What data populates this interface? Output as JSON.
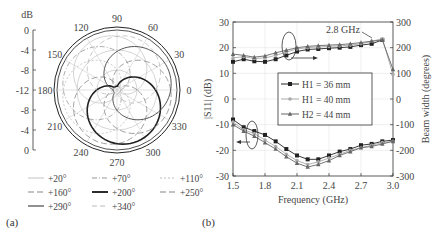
{
  "panel_labels": {
    "a": "(a)",
    "b": "(b)"
  },
  "polar": {
    "radial_unit": "dB",
    "radial_ticks": [
      "0",
      "-4",
      "-8",
      "-12",
      "-8",
      "-4",
      "0"
    ],
    "angle_ticks": [
      "0",
      "30",
      "60",
      "90",
      "120",
      "150",
      "180",
      "210",
      "240",
      "270",
      "300",
      "330"
    ],
    "legend": [
      "+20°",
      "+70°",
      "+110°",
      "+160°",
      "+200°",
      "+250°",
      "+290°",
      "+340°"
    ]
  },
  "right": {
    "legend": [
      "H1 = 36 mm",
      "H1 = 40 mm",
      "H2 = 44 mm"
    ],
    "annotation": "2.8 GHz",
    "xlabel": "Frequency (GHz)",
    "ylabel_left": "|S11| (dB)",
    "ylabel_right": "Beam width (degrees)",
    "x_ticks": [
      "1.5",
      "1.8",
      "2.1",
      "2.4",
      "2.7",
      "3.0"
    ],
    "y_left_ticks": [
      "30",
      "20",
      "10",
      "0",
      "-10",
      "-20",
      "-30"
    ],
    "y_right_ticks": [
      "300",
      "200",
      "100",
      "0",
      "-100",
      "-200",
      "-300"
    ]
  },
  "chart_data": [
    {
      "type": "line",
      "title": "(a) Radiation patterns (polar)",
      "radial_range_db": [
        -12,
        0
      ],
      "angle_ticks_deg": [
        0,
        30,
        60,
        90,
        120,
        150,
        180,
        210,
        240,
        270,
        300,
        330
      ],
      "series_names": [
        "+20°",
        "+70°",
        "+110°",
        "+160°",
        "+200°",
        "+250°",
        "+290°",
        "+340°"
      ],
      "highlight_series": "+200°",
      "polar": true
    },
    {
      "type": "line",
      "title": "(b) |S11| and beam width vs frequency",
      "xlabel": "Frequency (GHz)",
      "ylabel": "|S11| (dB)",
      "ylabel_right": "Beam width (degrees)",
      "xlim": [
        1.5,
        3.0
      ],
      "ylim": [
        -30,
        30
      ],
      "ylim_right": [
        -300,
        300
      ],
      "x": [
        1.5,
        1.6,
        1.7,
        1.8,
        1.9,
        2.0,
        2.1,
        2.2,
        2.3,
        2.4,
        2.5,
        2.6,
        2.7,
        2.8,
        2.9,
        3.0
      ],
      "series": [
        {
          "name": "H1 = 36 mm |S11|",
          "axis": "left",
          "values": [
            -8,
            -11,
            -12.5,
            -14,
            -16.5,
            -19.5,
            -22,
            -23.5,
            -23.5,
            -22,
            -20.5,
            -19.5,
            -18,
            -17.5,
            -16.5,
            -16
          ]
        },
        {
          "name": "H1 = 40 mm |S11|",
          "axis": "left",
          "values": [
            -9,
            -12,
            -13.5,
            -16,
            -18.5,
            -21.5,
            -24,
            -25.5,
            -24.5,
            -23,
            -21.5,
            -20,
            -19,
            -18,
            -17,
            -16.5
          ]
        },
        {
          "name": "H2 = 44 mm |S11|",
          "axis": "left",
          "values": [
            -10,
            -12.5,
            -14.5,
            -17,
            -19.5,
            -22.5,
            -25,
            -26.5,
            -25.5,
            -24,
            -22,
            -20.5,
            -19,
            -18.5,
            -17.5,
            -16.5
          ]
        },
        {
          "name": "H1 = 36 mm beam width",
          "axis": "right",
          "values": [
            145,
            155,
            147,
            145,
            155,
            170,
            185,
            193,
            195,
            198,
            200,
            203,
            210,
            215,
            230,
            null
          ]
        },
        {
          "name": "H1 = 40 mm beam width",
          "axis": "right",
          "values": [
            160,
            165,
            158,
            160,
            170,
            183,
            195,
            200,
            203,
            205,
            207,
            210,
            215,
            225,
            235,
            95
          ]
        },
        {
          "name": "H2 = 44 mm beam width",
          "axis": "right",
          "values": [
            175,
            170,
            163,
            168,
            180,
            190,
            200,
            205,
            208,
            210,
            212,
            215,
            220,
            225,
            230,
            115
          ]
        }
      ],
      "annotations": [
        "2.8 GHz"
      ]
    }
  ]
}
